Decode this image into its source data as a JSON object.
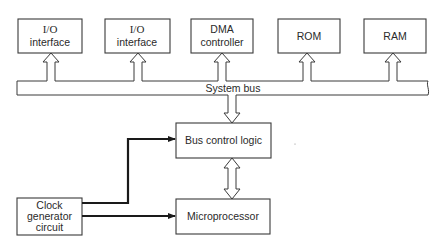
{
  "diagram": {
    "bus": {
      "label": "System bus"
    },
    "top_blocks": [
      {
        "id": "io1",
        "line1": "I/O",
        "line2": "interface"
      },
      {
        "id": "io2",
        "line1": "I/O",
        "line2": "interface"
      },
      {
        "id": "dma",
        "line1": "DMA",
        "line2": "controller"
      },
      {
        "id": "rom",
        "line1": "ROM"
      },
      {
        "id": "ram",
        "line1": "RAM"
      }
    ],
    "bus_control": {
      "label": "Bus control logic"
    },
    "microprocessor": {
      "label": "Microprocessor"
    },
    "clock": {
      "line1": "Clock",
      "line2": "generator",
      "line3": "circuit"
    },
    "connections": [
      {
        "from": "io1",
        "to": "System bus",
        "type": "bidirectional-bus"
      },
      {
        "from": "io2",
        "to": "System bus",
        "type": "bidirectional-bus"
      },
      {
        "from": "dma",
        "to": "System bus",
        "type": "bidirectional-bus"
      },
      {
        "from": "rom",
        "to": "System bus",
        "type": "bidirectional-bus"
      },
      {
        "from": "ram",
        "to": "System bus",
        "type": "bidirectional-bus"
      },
      {
        "from": "System bus",
        "to": "Bus control logic",
        "type": "bidirectional-bus"
      },
      {
        "from": "Bus control logic",
        "to": "Microprocessor",
        "type": "bidirectional-bus"
      },
      {
        "from": "Clock generator circuit",
        "to": "Bus control logic",
        "type": "signal"
      },
      {
        "from": "Clock generator circuit",
        "to": "Microprocessor",
        "type": "signal"
      }
    ],
    "colors": {
      "line": "#3a3a3a",
      "wire": "#1a1a1a",
      "text": "#2a2a2a",
      "background": "#ffffff"
    }
  }
}
